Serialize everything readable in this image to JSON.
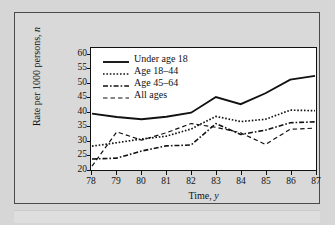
{
  "figure": {
    "background_color": "#d9d9d9",
    "panel_color": "#ffffff",
    "line_color": "#111111"
  },
  "chart_data": {
    "type": "line",
    "title": "",
    "xlabel": "Time, y",
    "ylabel": "Rate per 1000 persons, n",
    "x": [
      78,
      79,
      80,
      81,
      82,
      83,
      84,
      85,
      86,
      87
    ],
    "xticklabels": [
      "78",
      "79",
      "80",
      "81",
      "82",
      "83",
      "84",
      "85",
      "86",
      "87"
    ],
    "yticklabels": [
      "20",
      "25",
      "30",
      "35",
      "40",
      "45",
      "50",
      "55",
      "60"
    ],
    "xlim": [
      78,
      87
    ],
    "ylim": [
      20,
      62
    ],
    "grid": false,
    "legend_position": "upper-left-inside",
    "series": [
      {
        "name": "Under age 18",
        "style": "solid",
        "values": [
          39.4,
          38.2,
          37.4,
          38.3,
          39.7,
          45.2,
          42.7,
          46.5,
          51.3,
          52.6
        ]
      },
      {
        "name": "Age 18–44",
        "style": "dotted",
        "values": [
          28.0,
          29.2,
          30.5,
          31.5,
          34.0,
          38.4,
          36.6,
          37.4,
          40.6,
          40.4
        ]
      },
      {
        "name": "Age 45–64",
        "style": "dash-dot",
        "values": [
          23.5,
          23.8,
          26.3,
          28.1,
          28.4,
          35.9,
          32.1,
          33.6,
          36.2,
          36.5
        ]
      },
      {
        "name": "All ages",
        "style": "dashed",
        "values": [
          21.0,
          33.0,
          30.1,
          32.7,
          35.9,
          34.6,
          32.7,
          28.6,
          33.9,
          34.3
        ]
      }
    ]
  },
  "legend": {
    "items": [
      {
        "label": "Under age 18",
        "style": "solid"
      },
      {
        "label": "Age 18–44",
        "style": "dotted"
      },
      {
        "label": "Age 45–64",
        "style": "dash-dot"
      },
      {
        "label": "All ages",
        "style": "dashed"
      }
    ]
  },
  "axis_titles": {
    "y_prefix": "Rate per 1000 persons, ",
    "y_italic": "n",
    "x_prefix": "Time, ",
    "x_italic": "y"
  }
}
